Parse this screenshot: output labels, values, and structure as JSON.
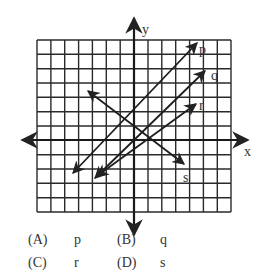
{
  "figure": {
    "axes": {
      "x_label": "x",
      "y_label": "y"
    },
    "grid": {
      "columns": 14,
      "rows": 12
    },
    "lines": [
      {
        "name": "p",
        "label": "p"
      },
      {
        "name": "q",
        "label": "q"
      },
      {
        "name": "r",
        "label": "r"
      },
      {
        "name": "s",
        "label": "s"
      }
    ]
  },
  "choices": [
    {
      "letter": "(A)",
      "value": "p"
    },
    {
      "letter": "(B)",
      "value": "q"
    },
    {
      "letter": "(C)",
      "value": "r"
    },
    {
      "letter": "(D)",
      "value": "s"
    }
  ]
}
